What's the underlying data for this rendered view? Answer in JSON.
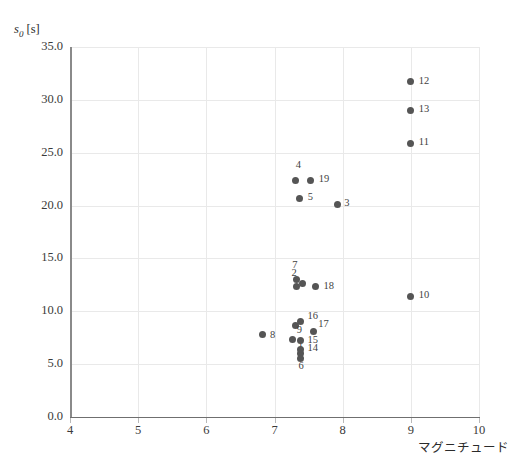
{
  "chart_data": {
    "type": "scatter",
    "title": "",
    "ylabel": "s0 [s]",
    "ylabel_symbol": "s",
    "ylabel_subscript": "0",
    "ylabel_unit": "[s]",
    "xlabel": "マグニチュード",
    "xlim": [
      4,
      10
    ],
    "ylim": [
      0.0,
      35.0
    ],
    "xticks": [
      4,
      5,
      6,
      7,
      8,
      9,
      10
    ],
    "xtick_labels": [
      "4",
      "5",
      "6",
      "7",
      "8",
      "9",
      "10"
    ],
    "yticks": [
      0.0,
      5.0,
      10.0,
      15.0,
      20.0,
      25.0,
      30.0,
      35.0
    ],
    "ytick_labels": [
      "0.0",
      "5.0",
      "10.0",
      "15.0",
      "20.0",
      "25.0",
      "30.0",
      "35.0"
    ],
    "grid": true,
    "legend": false,
    "marker_color": "#555555",
    "points": [
      {
        "label": "1",
        "x": 7.27,
        "y": 7.3,
        "lx": 5,
        "ly": 5
      },
      {
        "label": "2",
        "x": 7.41,
        "y": 12.6,
        "lx": -11,
        "ly": -12
      },
      {
        "label": "3",
        "x": 7.92,
        "y": 20.1,
        "lx": 7,
        "ly": -3
      },
      {
        "label": "4",
        "x": 7.31,
        "y": 22.4,
        "lx": 0,
        "ly": -16
      },
      {
        "label": "5",
        "x": 7.37,
        "y": 20.7,
        "lx": 8,
        "ly": -2
      },
      {
        "label": "6",
        "x": 7.38,
        "y": 5.5,
        "lx": -2,
        "ly": 6
      },
      {
        "label": "7",
        "x": 7.32,
        "y": 13.0,
        "lx": -4,
        "ly": -16
      },
      {
        "label": "8",
        "x": 6.83,
        "y": 7.8,
        "lx": 7,
        "ly": -1
      },
      {
        "label": "9",
        "x": 7.31,
        "y": 8.7,
        "lx": 1,
        "ly": 4
      },
      {
        "label": "10",
        "x": 9.0,
        "y": 11.4,
        "lx": 8,
        "ly": -2
      },
      {
        "label": "11",
        "x": 9.0,
        "y": 25.9,
        "lx": 8,
        "ly": -2
      },
      {
        "label": "12",
        "x": 9.0,
        "y": 31.7,
        "lx": 8,
        "ly": -2
      },
      {
        "label": "13",
        "x": 9.0,
        "y": 29.0,
        "lx": 8,
        "ly": -2
      },
      {
        "label": "14",
        "x": 7.38,
        "y": 6.4,
        "lx": 7,
        "ly": -2
      },
      {
        "label": "15",
        "x": 7.38,
        "y": 7.2,
        "lx": 7,
        "ly": -2
      },
      {
        "label": "16",
        "x": 7.38,
        "y": 9.0,
        "lx": 7,
        "ly": -7
      },
      {
        "label": "17",
        "x": 7.57,
        "y": 8.1,
        "lx": 5,
        "ly": -8
      },
      {
        "label": "18",
        "x": 7.6,
        "y": 12.3,
        "lx": 8,
        "ly": -2
      },
      {
        "label": "19",
        "x": 7.53,
        "y": 22.4,
        "lx": 8,
        "ly": -2
      }
    ],
    "extra_points": [
      {
        "x": 7.32,
        "y": 12.3
      },
      {
        "x": 7.38,
        "y": 6.0
      }
    ]
  },
  "colors": {
    "marker": "#555555",
    "grid": "#e9e9e9",
    "axis": "#6f6f6f",
    "text": "#3a3a3a",
    "background": "#ffffff"
  }
}
